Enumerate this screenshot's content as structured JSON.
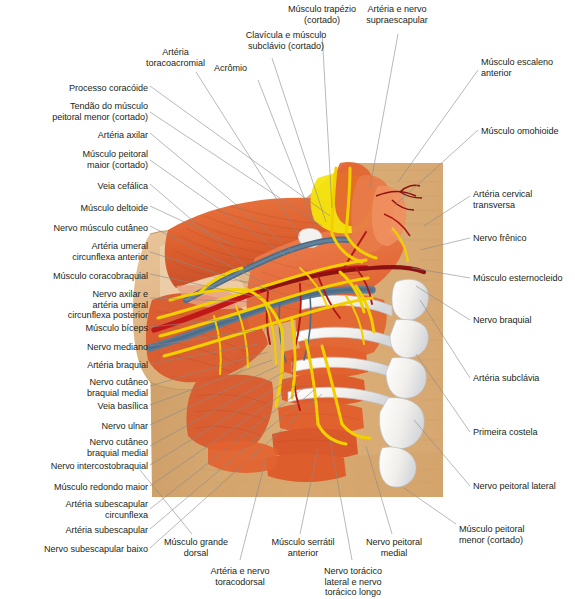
{
  "figure": {
    "language": "pt-BR",
    "type": "anatomical-illustration",
    "background_color": "#ffffff",
    "label_color": "#231f20",
    "leader_line_color": "#8a8a8a",
    "block_color": "#d9ac74"
  },
  "palette": {
    "muscle_orange": "#e2622f",
    "muscle_orange_light": "#ef7f4d",
    "muscle_dark_red": "#b8432a",
    "muscle_pale": "#e8a183",
    "artery_red": "#c01718",
    "artery_dark": "#8c1212",
    "vein_blue": "#5d7a93",
    "vein_dark_blue": "#3c5a78",
    "nerve_yellow": "#f2d000",
    "bone_white": "#f4f2ee",
    "bone_shadow": "#c9cdd3",
    "fat_yellow": "#f4e40d",
    "skin_tan": "#d9ac74",
    "skin_pale": "#efd0ac"
  },
  "labels_left": [
    {
      "id": "processo-coracoide",
      "text": "Processo coracóide",
      "x": 148,
      "y": 88,
      "lines": 1
    },
    {
      "id": "tendao-peitoral-menor",
      "text": "Tendão do músculo\npeitoral menor (cortado)",
      "x": 148,
      "y": 108,
      "lines": 2
    },
    {
      "id": "arteria-axilar",
      "text": "Artéria axilar",
      "x": 148,
      "y": 135,
      "lines": 1
    },
    {
      "id": "musculo-peitoral-maior",
      "text": "Músculo peitoral\nmaior (cortado)",
      "x": 148,
      "y": 155,
      "lines": 2
    },
    {
      "id": "veia-cefalica",
      "text": "Veia cefálica",
      "x": 148,
      "y": 185,
      "lines": 1
    },
    {
      "id": "musculo-deltoide",
      "text": "Músculo deltoide",
      "x": 148,
      "y": 208,
      "lines": 1
    },
    {
      "id": "nervo-musculo-cutaneo",
      "text": "Nervo músculo cutâneo",
      "x": 148,
      "y": 228,
      "lines": 1
    },
    {
      "id": "arteria-umeral-circ-ant",
      "text": "Artéria umeral\ncircunflexa anterior",
      "x": 148,
      "y": 247,
      "lines": 2
    },
    {
      "id": "musculo-coracobraquial",
      "text": "Músculo coracobraquial",
      "x": 148,
      "y": 275,
      "lines": 1
    },
    {
      "id": "nervo-axilar-arteria",
      "text": "Nervo axilar e\nartéria umeral\ncircunflexa posterior",
      "x": 148,
      "y": 292,
      "lines": 3
    },
    {
      "id": "musculo-biceps",
      "text": "Músculo bíceps",
      "x": 148,
      "y": 328,
      "lines": 1
    },
    {
      "id": "nervo-mediano",
      "text": "Nervo mediano",
      "x": 148,
      "y": 347,
      "lines": 1
    },
    {
      "id": "arteria-braquial",
      "text": "Artéria braquial",
      "x": 148,
      "y": 365,
      "lines": 1
    },
    {
      "id": "nervo-cutaneo-braquial-medial-1",
      "text": "Nervo cutâneo\nbraquial medial",
      "x": 148,
      "y": 381,
      "lines": 2
    },
    {
      "id": "veia-basilica",
      "text": "Veia basílica",
      "x": 148,
      "y": 406,
      "lines": 1
    },
    {
      "id": "nervo-ulnar",
      "text": "Nervo ulnar",
      "x": 148,
      "y": 426,
      "lines": 1
    },
    {
      "id": "nervo-cutaneo-braquial-medial-2",
      "text": "Nervo cutâneo\nbraquial medial",
      "x": 148,
      "y": 441,
      "lines": 2
    },
    {
      "id": "nervo-intercostobraquial",
      "text": "Nervo intercostobraquial",
      "x": 148,
      "y": 466,
      "lines": 1
    },
    {
      "id": "musculo-redondo-maior",
      "text": "Músculo redondo maior",
      "x": 148,
      "y": 487,
      "lines": 1
    },
    {
      "id": "arteria-subescapular-circunflexa",
      "text": "Artéria subescapular\ncircunflexa",
      "x": 148,
      "y": 504,
      "lines": 2
    },
    {
      "id": "arteria-subescapular",
      "text": "Artéria subescapular",
      "x": 148,
      "y": 530,
      "lines": 1
    },
    {
      "id": "nervo-subescapular-baixo",
      "text": "Nervo subescapular baixo",
      "x": 148,
      "y": 549,
      "lines": 1
    }
  ],
  "labels_top": [
    {
      "id": "arteria-toracoacromial",
      "text": "Artéria\ntoracoacromial",
      "x": 175,
      "y": 52,
      "align": "center"
    },
    {
      "id": "acromio",
      "text": "Acrômio",
      "x": 245,
      "y": 65,
      "align": "left"
    },
    {
      "id": "clavicula-musculo-subclavio",
      "text": "Clavícula e músculo\nsubclávio (cortado)",
      "x": 240,
      "y": 33,
      "align": "center"
    },
    {
      "id": "musculo-trapezio",
      "text": "Músculo trapézio\n(cortado)",
      "x": 315,
      "y": 6,
      "align": "center"
    },
    {
      "id": "arteria-nervo-supraescapular",
      "text": "Artéria e nervo\nsupraescapular",
      "x": 392,
      "y": 6,
      "align": "center"
    }
  ],
  "labels_right": [
    {
      "id": "musculo-escaleno-anterior",
      "text": "Músculo escaleno\nanterior",
      "x": 482,
      "y": 60,
      "lines": 2
    },
    {
      "id": "musculo-omohioide",
      "text": "Músculo omohioide",
      "x": 482,
      "y": 128,
      "lines": 1
    },
    {
      "id": "arteria-cervical-transversa",
      "text": "Artéria cervical\ntransversa",
      "x": 474,
      "y": 192,
      "lines": 2
    },
    {
      "id": "nervo-frenico",
      "text": "Nervo frênico",
      "x": 474,
      "y": 236,
      "lines": 1
    },
    {
      "id": "musculo-esternocleido",
      "text": "Músculo esternocleido",
      "x": 474,
      "y": 275,
      "lines": 1
    },
    {
      "id": "nervo-braquial",
      "text": "Nervo braquial",
      "x": 474,
      "y": 317,
      "lines": 1
    },
    {
      "id": "arteria-subclavia",
      "text": "Artéria subclávia",
      "x": 474,
      "y": 376,
      "lines": 1
    },
    {
      "id": "primeira-costela",
      "text": "Primeira costela",
      "x": 474,
      "y": 429,
      "lines": 1
    },
    {
      "id": "nervo-peitoral-lateral",
      "text": "Nervo peitoral lateral",
      "x": 474,
      "y": 484,
      "lines": 1
    },
    {
      "id": "musculo-peitoral-menor",
      "text": "Músculo peitoral\nmenor (cortado)",
      "x": 460,
      "y": 527,
      "lines": 2
    }
  ],
  "labels_bottom": [
    {
      "id": "musculo-grande-dorsal",
      "text": "Músculo grande\ndorsal",
      "x": 196,
      "y": 540,
      "align": "center"
    },
    {
      "id": "arteria-nervo-toracodorsal",
      "text": "Artéria e nervo\ntoracodorsal",
      "x": 240,
      "y": 569,
      "align": "center"
    },
    {
      "id": "musculo-serratil-anterior",
      "text": "Músculo serrátil\nanterior",
      "x": 303,
      "y": 540,
      "align": "center"
    },
    {
      "id": "nervo-toracico-lateral-longo",
      "text": "Nervo torácico\nlateral e nervo\ntorácico longo",
      "x": 353,
      "y": 569,
      "align": "center"
    },
    {
      "id": "nervo-peitoral-medial",
      "text": "Nervo peitoral\nmedial",
      "x": 394,
      "y": 540,
      "align": "center"
    }
  ]
}
